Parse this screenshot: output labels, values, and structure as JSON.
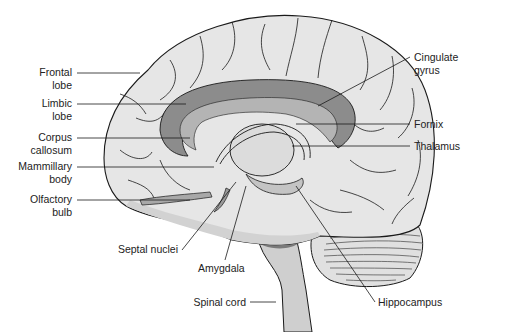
{
  "figure": {
    "colors": {
      "background": "#ffffff",
      "cortex_fill": "#e6e6e6",
      "cortex_shade": "#d2d2d2",
      "limbic_fill": "#8c8c8c",
      "limbic_inner": "#b4b4b4",
      "thalamus_fill": "#dcdcdc",
      "brainstem_fill": "#c8c8c8",
      "cerebellum_fill": "#e0e0e0",
      "outline": "#1a1a1a",
      "leader_line": "#1a1a1a",
      "label_text": "#222222"
    },
    "labels_left": [
      {
        "line1": "Frontal",
        "line2": "lobe"
      },
      {
        "line1": "Limbic",
        "line2": "lobe"
      },
      {
        "line1": "Corpus",
        "line2": "callosum"
      },
      {
        "line1": "Mammillary",
        "line2": "body"
      },
      {
        "line1": "Olfactory",
        "line2": "bulb"
      }
    ],
    "labels_right": [
      {
        "line1": "Cingulate",
        "line2": "gyrus"
      },
      {
        "line1": "Fornix",
        "line2": ""
      },
      {
        "line1": "Thalamus",
        "line2": ""
      }
    ],
    "labels_bottom": [
      {
        "text": "Septal nuclei"
      },
      {
        "text": "Amygdala"
      },
      {
        "text": "Spinal cord"
      },
      {
        "text": "Hippocampus"
      }
    ]
  }
}
